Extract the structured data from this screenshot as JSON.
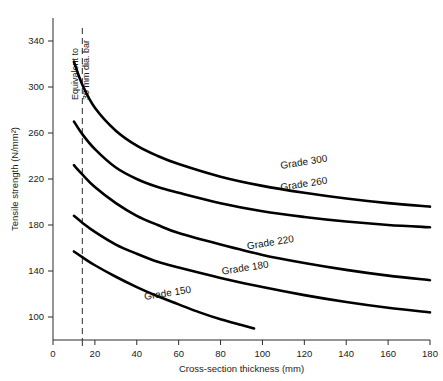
{
  "chart_data": {
    "type": "line",
    "title": "",
    "xlabel": "Cross-section thickness (mm)",
    "ylabel": "Tensile strength (N/mm²)",
    "xlim": [
      0,
      180
    ],
    "ylim": [
      80,
      360
    ],
    "xticks": [
      0,
      20,
      40,
      60,
      80,
      100,
      120,
      140,
      160,
      180
    ],
    "xtick_labels": [
      "0",
      "20",
      "40",
      "60",
      "80",
      "100",
      "120",
      "140",
      "160",
      "180"
    ],
    "yticks": [
      100,
      140,
      180,
      220,
      260,
      300,
      340
    ],
    "ytick_labels": [
      "100",
      "140",
      "180",
      "220",
      "260",
      "300",
      "340"
    ],
    "grid": false,
    "legend_position": "inline-right-of-curve",
    "annotations": [
      {
        "name": "equivalent-bar-marker",
        "text_line1": "Equivalent to",
        "text_line2": "30 mm dia. bar",
        "x_value": 14,
        "style": "dashed-vertical-line"
      }
    ],
    "series": [
      {
        "name": "Grade 300",
        "label": "Grade 300",
        "label_x": 120,
        "label_y": 232,
        "x": [
          10,
          14,
          20,
          30,
          40,
          50,
          60,
          80,
          100,
          120,
          140,
          160,
          180
        ],
        "y": [
          322,
          302,
          282,
          262,
          249,
          240,
          233,
          222,
          214,
          208,
          203,
          199,
          196
        ]
      },
      {
        "name": "Grade 260",
        "label": "Grade 260",
        "label_x": 120,
        "label_y": 213,
        "x": [
          10,
          14,
          20,
          30,
          40,
          50,
          60,
          80,
          100,
          120,
          140,
          160,
          180
        ],
        "y": [
          270,
          259,
          246,
          230,
          220,
          213,
          208,
          199,
          192,
          187,
          183,
          180,
          178
        ]
      },
      {
        "name": "Grade 220",
        "label": "Grade 220",
        "label_x": 104,
        "label_y": 162,
        "x": [
          10,
          14,
          20,
          30,
          40,
          50,
          60,
          80,
          100,
          120,
          140,
          160,
          180
        ],
        "y": [
          232,
          224,
          213,
          199,
          188,
          180,
          173,
          163,
          154,
          147,
          141,
          136,
          132
        ]
      },
      {
        "name": "Grade 180",
        "label": "Grade 180",
        "label_x": 92,
        "label_y": 140,
        "x": [
          10,
          14,
          20,
          30,
          40,
          50,
          60,
          80,
          100,
          120,
          140,
          160,
          180
        ],
        "y": [
          188,
          182,
          174,
          163,
          155,
          148,
          143,
          134,
          126,
          119,
          113,
          108,
          104
        ]
      },
      {
        "name": "Grade 150",
        "label": "Grade 150",
        "label_x": 55,
        "label_y": 118,
        "x": [
          10,
          14,
          20,
          30,
          40,
          50,
          60,
          70,
          80,
          90,
          96
        ],
        "y": [
          157,
          152,
          145,
          135,
          126,
          118,
          111,
          104,
          98,
          93,
          90
        ]
      }
    ]
  },
  "axes": {
    "y_axis_title": "Tensile strength (N/mm²)",
    "x_axis_title": "Cross-section thickness (mm)"
  }
}
